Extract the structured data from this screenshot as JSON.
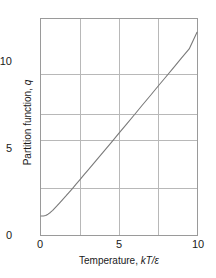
{
  "chart_data": {
    "type": "line",
    "title": "",
    "xlabel": "Temperature, kT/ε",
    "ylabel": "Partition function, q",
    "xlabel_parts": {
      "prefix": "Temperature, ",
      "symbol": "kT/ε"
    },
    "ylabel_parts": {
      "prefix": "Partition function, ",
      "symbol": "q"
    },
    "xlim": [
      0,
      10
    ],
    "ylim": [
      0,
      11.4
    ],
    "grid": true,
    "legend": "none",
    "x_major_ticks": [
      0,
      5,
      10
    ],
    "x_major_tick_labels": [
      "0",
      "5",
      "10"
    ],
    "y_major_ticks": [
      0,
      5,
      10
    ],
    "y_major_tick_labels": [
      "0",
      "5",
      "10"
    ],
    "x_gridlines": [
      2.5,
      5,
      7.5
    ],
    "y_gridlines": [
      2.5,
      5,
      7.5,
      10
    ],
    "line_color": "#7a7a7a",
    "grid_color": "#b8b8b8",
    "frame_color": "#9a9a9a",
    "series": [
      {
        "name": "q",
        "x": [
          0.0,
          0.15,
          0.3,
          0.45,
          0.6,
          0.75,
          0.9,
          1.05,
          1.2,
          1.4,
          1.6,
          1.8,
          2.0,
          2.25,
          2.5,
          2.75,
          3.0,
          3.5,
          4.0,
          4.5,
          5.0,
          5.5,
          6.0,
          6.5,
          7.0,
          7.5,
          8.0,
          8.5,
          9.0,
          9.5,
          10.0
        ],
        "y": [
          1.0,
          1.0,
          1.03,
          1.1,
          1.19,
          1.3,
          1.43,
          1.56,
          1.7,
          1.88,
          2.06,
          2.25,
          2.44,
          2.68,
          2.92,
          3.17,
          3.41,
          3.9,
          4.39,
          4.88,
          5.38,
          5.87,
          6.36,
          6.86,
          7.35,
          7.85,
          8.34,
          8.83,
          9.33,
          9.82,
          10.7
        ]
      }
    ]
  }
}
